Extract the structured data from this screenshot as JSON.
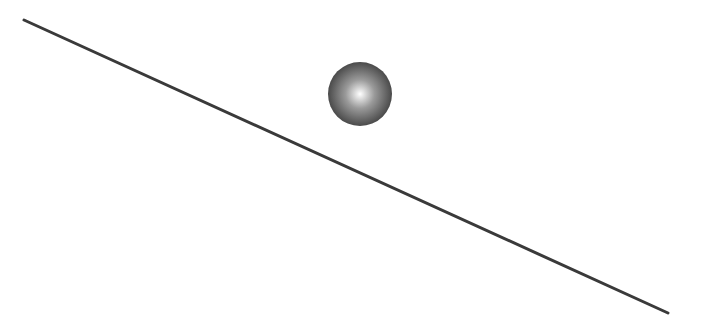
{
  "scene": {
    "width": 705,
    "height": 330,
    "background": "#ffffff",
    "incline": {
      "x1": 24,
      "y1": 20,
      "x2": 668,
      "y2": 313,
      "color": "#3a3a3a",
      "stroke_width": 3
    },
    "ball": {
      "cx": 360,
      "cy": 94,
      "r": 32,
      "highlight_color": "#ffffff",
      "mid_color": "#9a9a9a",
      "edge_color": "#4a4a4a"
    }
  }
}
